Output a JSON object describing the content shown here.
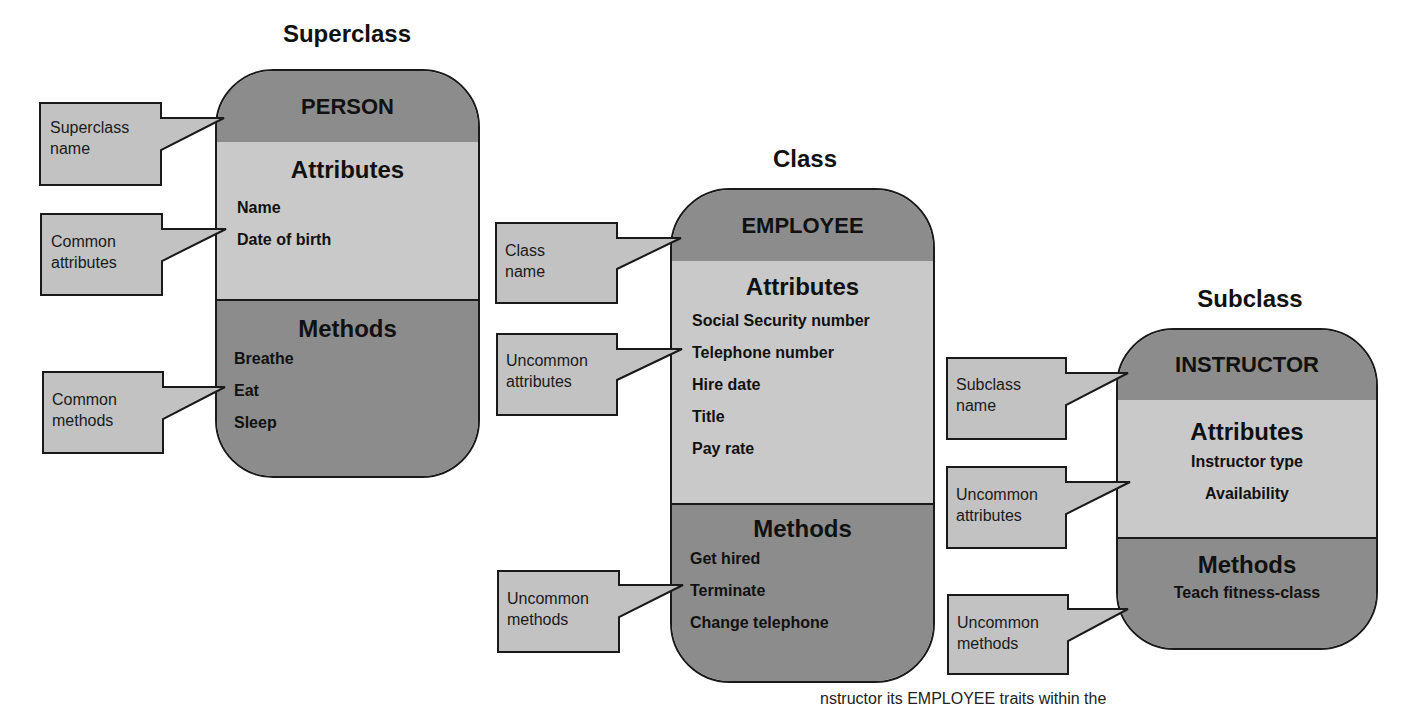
{
  "colors": {
    "header_fill": "#8c8c8c",
    "attributes_fill": "#c9c9c9",
    "methods_fill": "#8c8c8c",
    "callout_fill": "#c2c2c2",
    "outline": "#1a1a1a"
  },
  "tiers": {
    "superclass": "Superclass",
    "class": "Class",
    "subclass": "Subclass"
  },
  "classes": {
    "person": {
      "name": "PERSON",
      "attributes_title": "Attributes",
      "attributes": [
        "Name",
        "Date of birth"
      ],
      "methods_title": "Methods",
      "methods": [
        "Breathe",
        "Eat",
        "Sleep"
      ]
    },
    "employee": {
      "name": "EMPLOYEE",
      "attributes_title": "Attributes",
      "attributes": [
        "Social Security number",
        "Telephone number",
        "Hire date",
        "Title",
        "Pay rate"
      ],
      "methods_title": "Methods",
      "methods": [
        "Get hired",
        "Terminate",
        "Change telephone"
      ]
    },
    "instructor": {
      "name": "INSTRUCTOR",
      "attributes_title": "Attributes",
      "attributes": [
        "Instructor type",
        "Availability"
      ],
      "methods_title": "Methods",
      "methods": [
        "Teach fitness-class"
      ]
    }
  },
  "callouts": {
    "superclass_name": [
      "Superclass",
      "name"
    ],
    "common_attributes": [
      "Common",
      "attributes"
    ],
    "common_methods": [
      "Common",
      "methods"
    ],
    "class_name": [
      "Class",
      "name"
    ],
    "uncommon_attributes_employee": [
      "Uncommon",
      "attributes"
    ],
    "uncommon_methods_employee": [
      "Uncommon",
      "methods"
    ],
    "subclass_name": [
      "Subclass",
      "name"
    ],
    "uncommon_attributes_instructor": [
      "Uncommon",
      "attributes"
    ],
    "uncommon_methods_instructor": [
      "Uncommon",
      "methods"
    ]
  },
  "footer": {
    "partial_text": "nstructor              its EMPLOYEE  traits    within the"
  }
}
